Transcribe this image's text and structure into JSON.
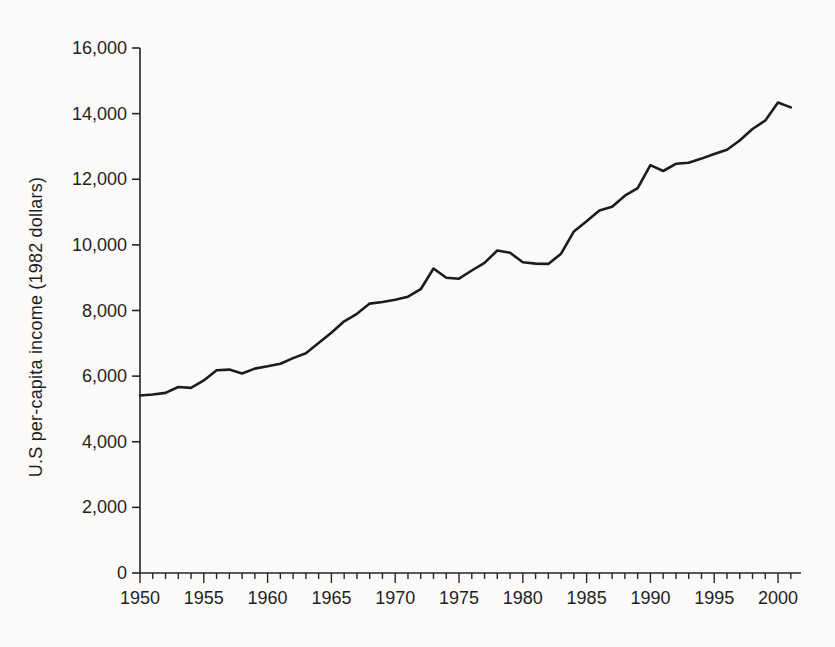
{
  "chart_data": {
    "type": "line",
    "title": "",
    "xlabel": "",
    "ylabel": "U.S per-capita income (1982 dollars)",
    "x": [
      1950,
      1951,
      1952,
      1953,
      1954,
      1955,
      1956,
      1957,
      1958,
      1959,
      1960,
      1961,
      1962,
      1963,
      1964,
      1965,
      1966,
      1967,
      1968,
      1969,
      1970,
      1971,
      1972,
      1973,
      1974,
      1975,
      1976,
      1977,
      1978,
      1979,
      1980,
      1981,
      1982,
      1983,
      1984,
      1985,
      1986,
      1987,
      1988,
      1989,
      1990,
      1991,
      1992,
      1993,
      1994,
      1995,
      1996,
      1997,
      1998,
      1999,
      2000,
      2001
    ],
    "series": [
      {
        "name": "U.S per-capita income (1982 dollars)",
        "values": [
          5410,
          5440,
          5490,
          5670,
          5640,
          5870,
          6180,
          6200,
          6080,
          6230,
          6300,
          6380,
          6550,
          6700,
          7010,
          7320,
          7670,
          7900,
          8210,
          8260,
          8330,
          8420,
          8650,
          9280,
          9000,
          8970,
          9220,
          9450,
          9830,
          9760,
          9470,
          9430,
          9420,
          9730,
          10410,
          10720,
          11050,
          11160,
          11500,
          11730,
          12430,
          12250,
          12470,
          12500,
          12630,
          12770,
          12900,
          13180,
          13530,
          13790,
          14340,
          14190
        ]
      }
    ],
    "xlim": [
      1950,
      2001.8
    ],
    "ylim": [
      0,
      16000
    ],
    "x_major_ticks": [
      1950,
      1955,
      1960,
      1965,
      1970,
      1975,
      1980,
      1985,
      1990,
      1995,
      2000
    ],
    "x_tick_labels": [
      "1950",
      "1955",
      "1960",
      "1965",
      "1970",
      "1975",
      "1980",
      "1985",
      "1990",
      "1995",
      "2000"
    ],
    "x_minor_tick_step": 1,
    "y_ticks": [
      0,
      2000,
      4000,
      6000,
      8000,
      10000,
      12000,
      14000,
      16000
    ],
    "y_tick_labels": [
      "0",
      "2,000",
      "4,000",
      "6,000",
      "8,000",
      "10,000",
      "12,000",
      "14,000",
      "16,000"
    ],
    "grid": false,
    "legend": "none",
    "line_color": "#1c1c1c",
    "axis_color": "#262626",
    "text_color": "#1f1f1f",
    "background": "#fbfaf8"
  }
}
